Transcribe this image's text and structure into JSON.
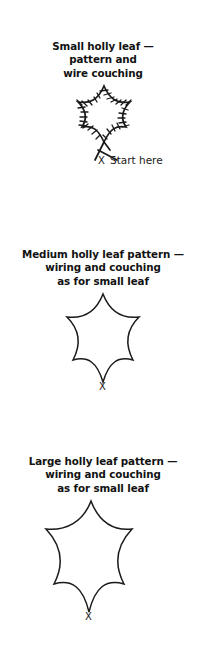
{
  "document": {
    "background_color": "#ffffff",
    "ink_color": "#1a1a1a",
    "title": "Holly leaf patterns — wiring and couching"
  },
  "sections": [
    {
      "id": "small",
      "caption_lines": [
        "Small holly leaf —",
        "pattern and",
        "wire couching"
      ],
      "figure": {
        "name": "small-holly-leaf-diagram",
        "style": "outline-with-couching-stitches",
        "has_couching_ticks": true,
        "tail_crossing": true
      },
      "start_marker": "X",
      "start_label": "Start here"
    },
    {
      "id": "medium",
      "caption_lines": [
        "Medium holly leaf pattern —",
        "wiring and couching",
        "as for small leaf"
      ],
      "figure": {
        "name": "medium-holly-leaf-diagram",
        "style": "plain-outline",
        "has_couching_ticks": false,
        "tail_crossing": false
      },
      "start_marker": "X",
      "start_label": ""
    },
    {
      "id": "large",
      "caption_lines": [
        "Large holly leaf pattern —",
        "wiring and couching",
        "as for small leaf"
      ],
      "figure": {
        "name": "large-holly-leaf-diagram",
        "style": "plain-outline",
        "has_couching_ticks": false,
        "tail_crossing": false
      },
      "start_marker": "X",
      "start_label": ""
    }
  ]
}
